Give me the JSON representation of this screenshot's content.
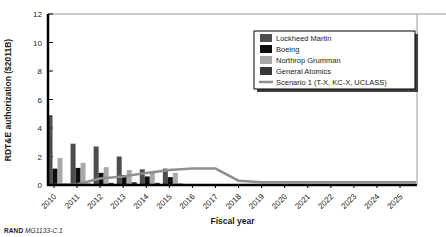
{
  "footer": {
    "brand": "RAND",
    "doc_id": "MG1133-C.1"
  },
  "chart_data": {
    "type": "bar",
    "title": "",
    "xlabel": "Fiscal year",
    "ylabel": "RDT&E authorization ($2011B)",
    "ylim": [
      0,
      12
    ],
    "yticks": [
      0,
      2,
      4,
      6,
      8,
      10,
      12
    ],
    "grid": false,
    "legend_position": "upper right",
    "categories": [
      "2010",
      "2011",
      "2012",
      "2013",
      "2014",
      "2015",
      "2016",
      "2017",
      "2018",
      "2019",
      "2020",
      "2021",
      "2022",
      "2023",
      "2024",
      "2025"
    ],
    "series": [
      {
        "name": "Lockheed Martin",
        "kind": "bar",
        "color": "#4d4d4d",
        "values": [
          4.9,
          2.9,
          2.7,
          2.0,
          1.1,
          1.15,
          0,
          0,
          0,
          0,
          0,
          0,
          0,
          0,
          0,
          0
        ]
      },
      {
        "name": "Boeing",
        "kind": "bar",
        "color": "#0d0d0d",
        "values": [
          1.15,
          1.2,
          0.85,
          0.7,
          0.6,
          0.55,
          0,
          0,
          0,
          0,
          0,
          0,
          0,
          0,
          0,
          0
        ]
      },
      {
        "name": "Northrop Grumman",
        "kind": "bar",
        "color": "#a9a9a9",
        "values": [
          1.9,
          1.55,
          1.25,
          1.05,
          0.95,
          0.85,
          0,
          0,
          0,
          0,
          0,
          0,
          0,
          0,
          0,
          0
        ]
      },
      {
        "name": "General Atomics",
        "kind": "bar",
        "color": "#363636",
        "values": [
          0.1,
          0.1,
          0.15,
          0.2,
          0.15,
          0.1,
          0,
          0,
          0,
          0,
          0,
          0,
          0,
          0,
          0,
          0
        ]
      },
      {
        "name": "Scenario 1 (T-X, KC-X, UCLASS)",
        "kind": "line",
        "color": "#8f8f8f",
        "values": [
          0,
          0.05,
          0.45,
          0.6,
          0.85,
          1.05,
          1.15,
          1.15,
          0.3,
          0.2,
          0.2,
          0.2,
          0.2,
          0.2,
          0.2,
          0.2
        ]
      }
    ],
    "colors": {
      "axis": "#000000",
      "frame": "#999999",
      "text": "#1a1a1a",
      "legend_border": "#000000",
      "legend_shadow": "#404040",
      "legend_bg": "#ffffff"
    }
  }
}
